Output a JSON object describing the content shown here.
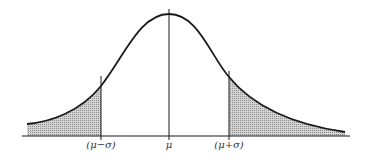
{
  "diagram": {
    "type": "normal-distribution-curve",
    "labels": {
      "minus_sigma": "(μ−σ)",
      "mean": "μ",
      "plus_sigma": "(μ+σ)"
    },
    "shaded_regions": [
      "left tail below (μ−σ)",
      "right tail above (μ+σ)"
    ],
    "colors": {
      "line": "#1a1a1a",
      "shade": "#b8b8b8"
    }
  }
}
